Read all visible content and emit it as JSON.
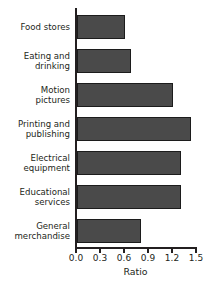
{
  "chart_data": {
    "type": "bar",
    "orientation": "horizontal",
    "title": "",
    "xlabel": "Ratio",
    "ylabel": "",
    "categories": [
      "Food stores",
      "Eating and drinking",
      "Motion pictures",
      "Printing and publishing",
      "Electrical equipment",
      "Educational services",
      "General merchandise"
    ],
    "category_lines": [
      "Food stores",
      "Eating and\ndrinking",
      "Motion\npictures",
      "Printing and\npublishing",
      "Electrical\nequipment",
      "Educational\nservices",
      "General\nmerchandise"
    ],
    "values": [
      0.6,
      0.68,
      1.2,
      1.42,
      1.3,
      1.3,
      0.8
    ],
    "xlim": [
      0.0,
      1.5
    ],
    "xticks": [
      0.0,
      0.3,
      0.6,
      0.9,
      1.2,
      1.5
    ],
    "xticklabels": [
      "0.0",
      "0.3",
      "0.6",
      "0.9",
      "1.2",
      "1.5"
    ],
    "grid": false,
    "legend": null,
    "bar_color": "#4a4a4a",
    "bar_edge_color": "#1c1c1c",
    "axis_color": "#231f20",
    "background_color": "#ffffff"
  }
}
